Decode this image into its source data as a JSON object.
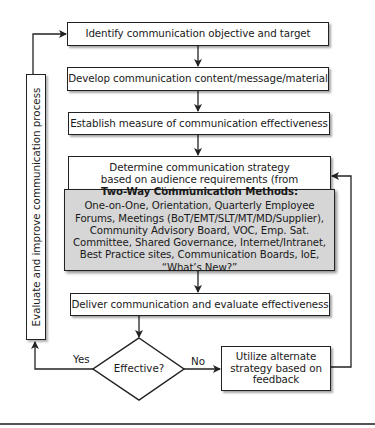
{
  "diagram": {
    "steps": [
      {
        "id": "identify",
        "label": "Identify communication objective and target"
      },
      {
        "id": "develop",
        "label": "Develop communication content/message/material"
      },
      {
        "id": "establish",
        "label": "Establish measure of communication effectiveness"
      },
      {
        "id": "determine",
        "label": "Determine communication strategy based on audience requirements (from listening posts)"
      },
      {
        "id": "deliver",
        "label": "Deliver communication and evaluate effectiveness"
      }
    ],
    "methods": {
      "title": "Two-Way Communication Methods:",
      "body": "One-on-One, Orientation, Quarterly Employee Forums, Meetings (BoT/EMT/SLT/MT/MD/Supplier), Community Advisory Board, VOC, Emp. Sat. Committee, Shared Governance, Internet/Intranet, Best Practice sites, Communication Boards, IoE, “What’s New?”"
    },
    "decision": {
      "label": "Effective?",
      "yes_label": "Yes",
      "no_label": "No"
    },
    "alternate": {
      "label": "Utilize alternate strategy based on feedback"
    },
    "loop": {
      "label": "Evaluate and improve communication process"
    }
  }
}
